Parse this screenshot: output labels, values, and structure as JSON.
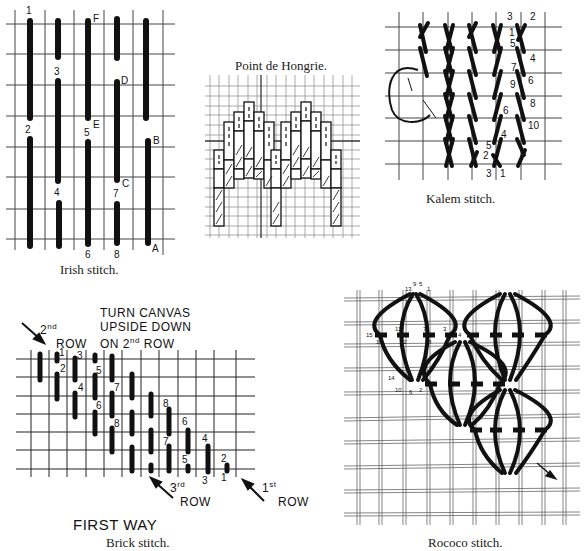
{
  "figures": {
    "irish": {
      "caption": "Irish stitch.",
      "labels": [
        "1",
        "2",
        "3",
        "4",
        "5",
        "6",
        "7",
        "8",
        "A",
        "B",
        "C",
        "D",
        "E",
        "F"
      ]
    },
    "hongrie": {
      "caption": "Point de Hongrie."
    },
    "kalem": {
      "caption": "Kalem stitch.",
      "labels": [
        "1",
        "2",
        "3",
        "4",
        "5",
        "6",
        "7",
        "8",
        "9",
        "10",
        "1",
        "2",
        "3",
        "4",
        "5",
        "6"
      ]
    },
    "brick": {
      "title": "FIRST WAY",
      "caption": "Brick stitch.",
      "note_line1": "TURN CANVAS",
      "note_line2": "UPSIDE DOWN",
      "note_line3": "ON 2nd ROW",
      "row2_label_ord": "2nd",
      "row2_label": "ROW",
      "row3_label_ord": "3rd",
      "row3_label": "ROW",
      "row1_label_ord": "1st",
      "row1_label": "ROW",
      "labels": [
        "1",
        "2",
        "3",
        "4",
        "5",
        "6",
        "7",
        "8"
      ]
    },
    "rococo": {
      "caption": "Rococo stitch.",
      "labels": [
        "1",
        "2",
        "3",
        "4",
        "5",
        "6",
        "7",
        "8",
        "9",
        "10",
        "11",
        "12",
        "13",
        "14",
        "15",
        "16"
      ]
    }
  },
  "colors": {
    "ink": "#111111",
    "grid": "#555555",
    "paper": "#ffffff"
  }
}
